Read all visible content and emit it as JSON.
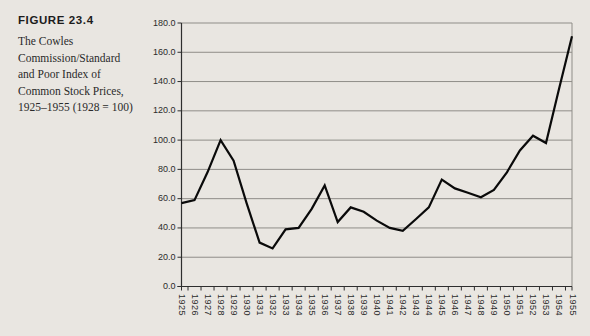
{
  "figure": {
    "label": "FIGURE 23.4",
    "caption_lines": [
      "The Cowles",
      "Commission/Standard",
      "and Poor Index of",
      "Common Stock Prices,",
      "1925–1955 (1928 = 100)"
    ]
  },
  "chart_data": {
    "type": "line",
    "title": "",
    "xlabel": "",
    "ylabel": "",
    "x": [
      "1925",
      "1926",
      "1927",
      "1928",
      "1929",
      "1930",
      "1931",
      "1932",
      "1933",
      "1934",
      "1935",
      "1936",
      "1937",
      "1938",
      "1939",
      "1940",
      "1941",
      "1942",
      "1943",
      "1944",
      "1945",
      "1946",
      "1947",
      "1948",
      "1949",
      "1950",
      "1951",
      "1952",
      "1953",
      "1954",
      "1955"
    ],
    "values": [
      57,
      59,
      78,
      100,
      86,
      57,
      30,
      26,
      39,
      40,
      53,
      69,
      44,
      54,
      51,
      45,
      40,
      38,
      46,
      54,
      73,
      67,
      64,
      61,
      66,
      78,
      93,
      103,
      98,
      135,
      171
    ],
    "ylim": [
      0,
      180
    ],
    "ytick_step": 20,
    "ytick_labels": [
      "0.0",
      "20.0",
      "40.0",
      "60.0",
      "80.0",
      "100.0",
      "120.0",
      "140.0",
      "160.0",
      "180.0"
    ],
    "grid": "horizontal",
    "legend": "none",
    "colors": {
      "background": "#e9e6e1",
      "gridline": "#8f8d88",
      "axis": "#2e2e2e",
      "series_line": "#0a0a0a",
      "tick_label": "#2b2b2b"
    }
  }
}
